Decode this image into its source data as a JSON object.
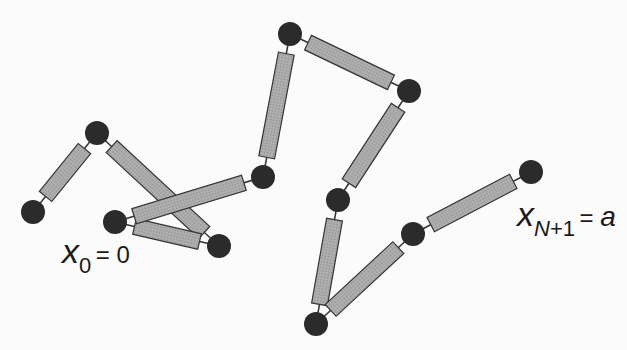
{
  "diagram": {
    "colors": {
      "bead": "#2b2b2b",
      "spring_fill": "#a9a9a9",
      "spring_stroke": "#333333",
      "connector": "#333333",
      "background": "#fbfbfb"
    },
    "beads": [
      {
        "id": "b0"
      },
      {
        "id": "b1"
      },
      {
        "id": "b2"
      },
      {
        "id": "b3"
      },
      {
        "id": "b4"
      },
      {
        "id": "b5"
      },
      {
        "id": "b6"
      },
      {
        "id": "b7"
      },
      {
        "id": "b8"
      },
      {
        "id": "b9"
      },
      {
        "id": "b10"
      },
      {
        "id": "b11"
      }
    ],
    "labels": {
      "start": {
        "var": "x",
        "sub": "0",
        "eq": "= 0"
      },
      "end": {
        "var": "x",
        "sub_var": "N",
        "sub_rest": "+1",
        "eq": "=",
        "value": "a"
      }
    }
  }
}
